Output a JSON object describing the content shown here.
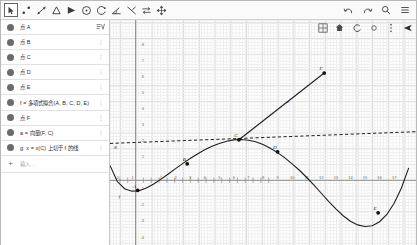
{
  "toolbar": {
    "tools": [
      {
        "name": "move-tool",
        "label": "Move",
        "selected": true
      },
      {
        "name": "point-tool",
        "label": "Point"
      },
      {
        "name": "line-tool",
        "label": "Line"
      },
      {
        "name": "polygon-tool",
        "label": "Polygon"
      },
      {
        "name": "angle-tool",
        "label": "Angle"
      },
      {
        "name": "circle-tool",
        "label": "Circle"
      },
      {
        "name": "arc-tool",
        "label": "Arc"
      },
      {
        "name": "measure-angle-tool",
        "label": "Measure Angle"
      },
      {
        "name": "reflect-tool",
        "label": "Reflect"
      },
      {
        "name": "slider-tool",
        "label": "Slider"
      },
      {
        "name": "move-graphics-tool",
        "label": "Move Graphics View"
      }
    ],
    "right_icons": [
      {
        "name": "undo-icon",
        "glyph": "↶"
      },
      {
        "name": "redo-icon",
        "glyph": "↷"
      },
      {
        "name": "search-icon",
        "glyph": "⚲"
      },
      {
        "name": "menu-icon",
        "glyph": "☰"
      }
    ]
  },
  "sidebar": {
    "items": [
      {
        "label": "点 A",
        "menu": "visibility-menu"
      },
      {
        "label": "点 B",
        "menu": "kebab"
      },
      {
        "label": "点 C",
        "menu": "kebab"
      },
      {
        "label": "点 D",
        "menu": "kebab"
      },
      {
        "label": "点 E",
        "menu": "kebab"
      },
      {
        "label": "f = 多项式拟合(A, B, C, D, E)",
        "menu": "kebab"
      },
      {
        "label": "点 F",
        "menu": "kebab"
      },
      {
        "label": "a = 向量(F, C)",
        "menu": "kebab"
      },
      {
        "label": "g: x = x(C) 上切于 f 的线",
        "menu": "kebab"
      }
    ],
    "input_placeholder": "输入…",
    "add_icon": "+"
  },
  "graphics": {
    "icons": [
      {
        "name": "grid-icon",
        "glyph": "⊞"
      },
      {
        "name": "home-icon",
        "glyph": "⌂"
      },
      {
        "name": "undo-view-icon",
        "glyph": "↺"
      },
      {
        "name": "zoom-icon",
        "glyph": "○"
      },
      {
        "name": "more-icon",
        "glyph": "⋮"
      },
      {
        "name": "pointer-icon",
        "glyph": "➤"
      }
    ]
  },
  "chart_data": {
    "type": "line",
    "title": "",
    "xlabel": "",
    "ylabel": "",
    "xlim": [
      -2.5,
      18.5
    ],
    "ylim": [
      -4.5,
      9.5
    ],
    "grid": true,
    "x_ticks": [
      -2,
      -1,
      1,
      2,
      3,
      4,
      5,
      6,
      7,
      8,
      9,
      10,
      11,
      12,
      13,
      14,
      15,
      16,
      17
    ],
    "y_ticks": [
      -4,
      -3,
      -2,
      -1,
      1,
      2,
      3,
      4,
      5,
      6,
      7,
      8
    ],
    "points": [
      {
        "label": "A",
        "x": -0.6,
        "y": -1.1
      },
      {
        "label": "B",
        "x": 2.8,
        "y": 0.55
      },
      {
        "label": "C",
        "x": 6.35,
        "y": 2.05
      },
      {
        "label": "D",
        "x": 9.0,
        "y": 1.3
      },
      {
        "label": "E",
        "x": 15.9,
        "y": -2.5
      },
      {
        "label": "F",
        "x": 12.2,
        "y": 6.2
      }
    ],
    "series": [
      {
        "name": "f",
        "type": "polynomial-fit-curve",
        "x": [
          -2.5,
          -2,
          -1.5,
          -1,
          -0.5,
          0,
          0.5,
          1,
          1.5,
          2,
          2.5,
          3,
          3.5,
          4,
          4.5,
          5,
          5.5,
          6,
          6.5,
          7,
          7.5,
          8,
          8.5,
          9,
          9.5,
          10,
          10.5,
          11,
          11.5,
          12,
          12.5,
          13,
          13.5,
          14,
          14.5,
          15,
          15.5,
          16,
          16.5,
          17,
          17.5,
          18
        ],
        "y": [
          0.45,
          -0.55,
          -1.0,
          -1.15,
          -1.12,
          -0.95,
          -0.7,
          -0.4,
          -0.08,
          0.25,
          0.58,
          0.88,
          1.16,
          1.42,
          1.64,
          1.82,
          1.96,
          2.04,
          2.06,
          2.02,
          1.92,
          1.75,
          1.52,
          1.25,
          0.92,
          0.55,
          0.15,
          -0.3,
          -0.78,
          -1.28,
          -1.78,
          -2.25,
          -2.68,
          -3.02,
          -3.25,
          -3.35,
          -3.3,
          -3.05,
          -2.6,
          -1.9,
          -0.95,
          0.3
        ]
      },
      {
        "name": "a",
        "type": "vector-segment",
        "from": {
          "x": 6.35,
          "y": 2.05
        },
        "to": {
          "x": 12.2,
          "y": 6.2
        }
      },
      {
        "name": "g",
        "type": "tangent-line-dashed",
        "x": [
          -2.5,
          18.5
        ],
        "y": [
          1.82,
          2.55
        ]
      }
    ],
    "annotations": [
      {
        "label": "f",
        "x": -1.9,
        "y": -1.6
      },
      {
        "label": "a",
        "x": 9.6,
        "y": 4.35
      },
      {
        "label": "g",
        "x": -2.2,
        "y": 1.55
      }
    ]
  }
}
